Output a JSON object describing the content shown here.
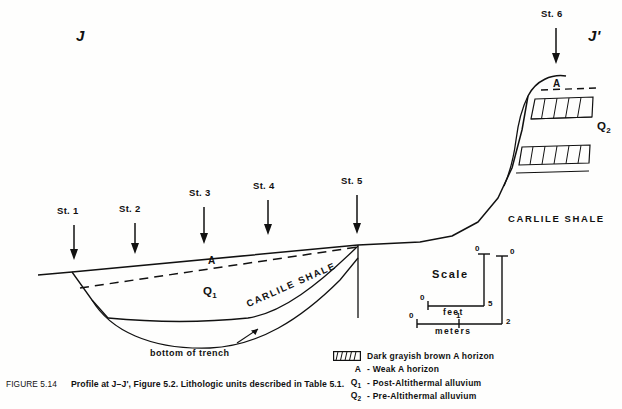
{
  "figure": {
    "endpoints": {
      "left": "J",
      "right": "J'"
    },
    "units": {
      "q1": "Q",
      "q1_sub": "1",
      "q2": "Q",
      "q2_sub": "2",
      "a_horizon": "A"
    },
    "bedrock_label_trench": "CARLILE SHALE",
    "bedrock_label_upland": "CARLILE SHALE",
    "trench_note": "bottom of trench",
    "stations": [
      {
        "label": "St. 1"
      },
      {
        "label": "St. 2"
      },
      {
        "label": "St. 3"
      },
      {
        "label": "St. 4"
      },
      {
        "label": "St. 5"
      },
      {
        "label": "St. 6"
      }
    ]
  },
  "scale": {
    "title": "Scale",
    "feet": {
      "unit": "feet",
      "min": "0",
      "max": "5"
    },
    "meters": {
      "unit": "meters",
      "min": "0",
      "mid": "1",
      "max": "2"
    },
    "vertical_feet": {
      "top": "0",
      "bottom": "5"
    },
    "vertical_meters": {
      "top": "0",
      "bottom": "2"
    }
  },
  "legend": {
    "items": [
      {
        "key_type": "swatch",
        "symbol": "",
        "symbol_sub": "",
        "text": "Dark grayish brown A horizon"
      },
      {
        "key_type": "symbol",
        "symbol": "A",
        "symbol_sub": "",
        "text": "- Weak A horizon"
      },
      {
        "key_type": "symbol",
        "symbol": "Q",
        "symbol_sub": "1",
        "text": "- Post-Altithermal alluvium"
      },
      {
        "key_type": "symbol",
        "symbol": "Q",
        "symbol_sub": "2",
        "text": "- Pre-Altithermal alluvium"
      }
    ]
  },
  "caption": {
    "number": "FIGURE 5.14",
    "text": "Profile at J–J', Figure 5.2. Lithologic units described in Table 5.1."
  },
  "colors": {
    "ink": "#111111",
    "background": "#fefefd"
  }
}
